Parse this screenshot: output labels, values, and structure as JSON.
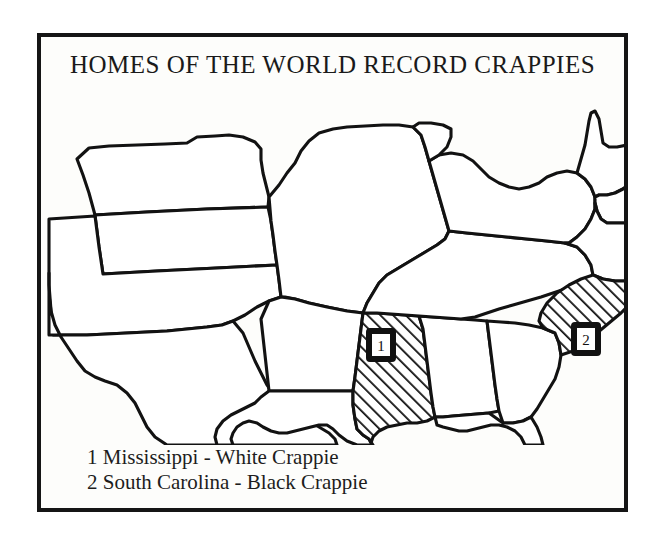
{
  "figure": {
    "title": "HOMES OF THE WORLD RECORD CRAPPIES",
    "background_color": "#ffffff",
    "frame_color": "#151515",
    "ink_color": "#121212"
  },
  "map": {
    "region": "Southeastern and South-Central United States",
    "highlight_fill": "diagonal-hatch",
    "highlighted_states": [
      "Mississippi",
      "South Carolina"
    ],
    "markers": [
      {
        "number": "1",
        "state": "Mississippi"
      },
      {
        "number": "2",
        "state": "South Carolina"
      }
    ]
  },
  "legend": {
    "entries": [
      {
        "number": "1",
        "state": "Mississippi",
        "species": "White Crappie",
        "text": "1 Mississippi - White Crappie"
      },
      {
        "number": "2",
        "state": "South Carolina",
        "species": "Black Crappie",
        "text": "2 South Carolina - Black Crappie"
      }
    ]
  }
}
